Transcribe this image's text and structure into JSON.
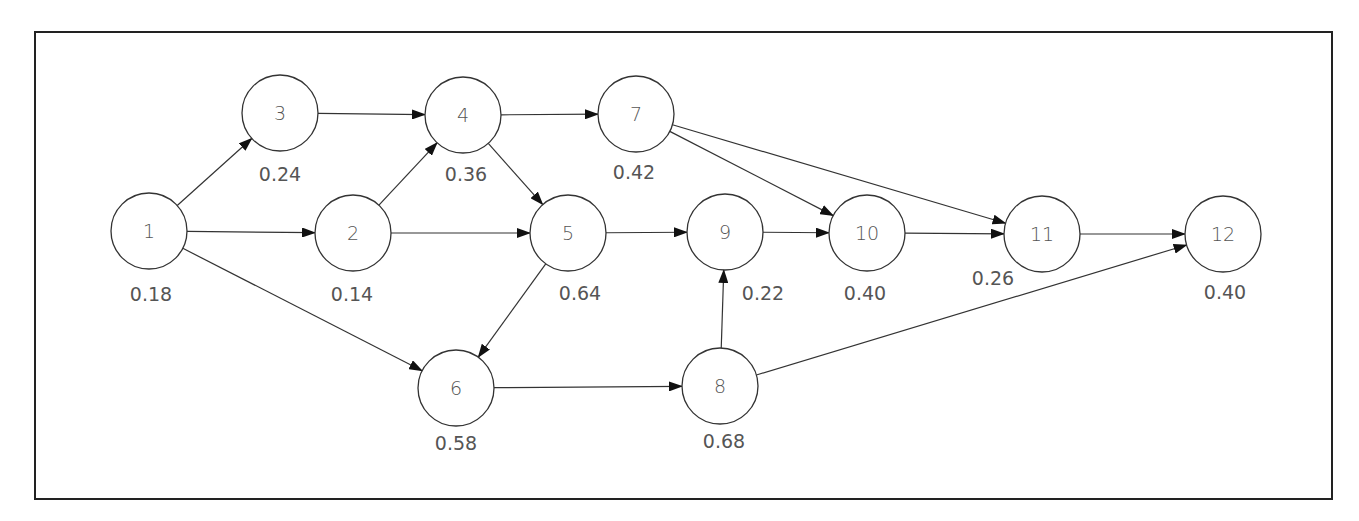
{
  "diagram": {
    "type": "directed-network",
    "frame": {
      "x": 35,
      "y": 32,
      "w": 1297,
      "h": 467
    },
    "node_radius": 38,
    "nodes": [
      {
        "id": "1",
        "label": "1",
        "value": "0.18",
        "x": 149,
        "y": 231,
        "vx": 151,
        "vy": 294
      },
      {
        "id": "2",
        "label": "2",
        "value": "0.14",
        "x": 353,
        "y": 233,
        "vx": 352,
        "vy": 294
      },
      {
        "id": "3",
        "label": "3",
        "value": "0.24",
        "x": 280,
        "y": 113,
        "vx": 280,
        "vy": 174
      },
      {
        "id": "4",
        "label": "4",
        "value": "0.36",
        "x": 463,
        "y": 115,
        "vx": 466,
        "vy": 174
      },
      {
        "id": "5",
        "label": "5",
        "value": "0.64",
        "x": 568,
        "y": 233,
        "vx": 580,
        "vy": 293
      },
      {
        "id": "6",
        "label": "6",
        "value": "0.58",
        "x": 456,
        "y": 388,
        "vx": 456,
        "vy": 443
      },
      {
        "id": "7",
        "label": "7",
        "value": "0.42",
        "x": 636,
        "y": 114,
        "vx": 634,
        "vy": 172
      },
      {
        "id": "8",
        "label": "8",
        "value": "0.68",
        "x": 720,
        "y": 386,
        "vx": 724,
        "vy": 441
      },
      {
        "id": "9",
        "label": "9",
        "value": "0.22",
        "x": 725,
        "y": 232,
        "vx": 763,
        "vy": 293
      },
      {
        "id": "10",
        "label": "10",
        "value": "0.40",
        "x": 867,
        "y": 233,
        "vx": 865,
        "vy": 293
      },
      {
        "id": "11",
        "label": "11",
        "value": "0.26",
        "x": 1042,
        "y": 234,
        "vx": 993,
        "vy": 278
      },
      {
        "id": "12",
        "label": "12",
        "value": "0.40",
        "x": 1223,
        "y": 234,
        "vx": 1225,
        "vy": 292
      }
    ],
    "edges": [
      {
        "from": "1",
        "to": "3"
      },
      {
        "from": "1",
        "to": "2"
      },
      {
        "from": "1",
        "to": "6"
      },
      {
        "from": "3",
        "to": "4"
      },
      {
        "from": "2",
        "to": "4"
      },
      {
        "from": "2",
        "to": "5"
      },
      {
        "from": "4",
        "to": "7"
      },
      {
        "from": "4",
        "to": "5"
      },
      {
        "from": "5",
        "to": "9"
      },
      {
        "from": "5",
        "to": "6"
      },
      {
        "from": "6",
        "to": "8"
      },
      {
        "from": "8",
        "to": "9"
      },
      {
        "from": "8",
        "to": "12"
      },
      {
        "from": "7",
        "to": "10"
      },
      {
        "from": "7",
        "to": "11"
      },
      {
        "from": "9",
        "to": "10"
      },
      {
        "from": "10",
        "to": "11"
      },
      {
        "from": "11",
        "to": "12"
      }
    ],
    "colors": {
      "stroke": "#333333",
      "text": "#555555",
      "background": "#ffffff"
    }
  }
}
